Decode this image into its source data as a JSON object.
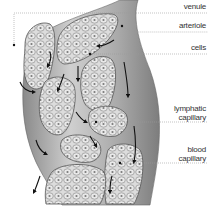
{
  "diagram": {
    "labels": [
      {
        "id": "venule",
        "lines": [
          "venule"
        ],
        "y": 2
      },
      {
        "id": "arteriole",
        "lines": [
          "arteriole"
        ],
        "y": 21
      },
      {
        "id": "cells",
        "lines": [
          "cells"
        ],
        "y": 44
      },
      {
        "id": "lymphatic-capillary",
        "lines": [
          "lymphatic",
          "capillary"
        ],
        "y": 100
      },
      {
        "id": "blood-capillary",
        "lines": [
          "blood",
          "capillary"
        ],
        "y": 142
      }
    ],
    "colors": {
      "background": "#ffffff",
      "vessel_fill": "#bdbdbd",
      "vessel_dark": "#7a7a7a",
      "cell_cluster_fill": "#d9d9d9",
      "cell_outline": "#6e6e6e",
      "arrow": "#111111",
      "leader_line": "#999999",
      "label_text": "#333333"
    }
  }
}
